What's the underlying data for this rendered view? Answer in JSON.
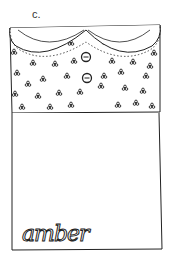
{
  "figure": {
    "label": "c.",
    "name_text": "amber",
    "colors": {
      "ink": "#222222",
      "paper": "#ffffff"
    },
    "elements": {
      "collar": "scalloped lace collar",
      "buttons": 2,
      "pattern": "trefoil dots",
      "pocket": "plain lower panel"
    }
  }
}
